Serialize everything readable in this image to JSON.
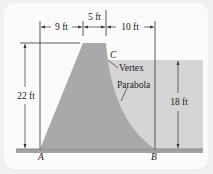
{
  "figure": {
    "dimensions": {
      "base_left": "9 ft",
      "top_width": "5 ft",
      "base_right": "10 ft",
      "dam_height": "22 ft",
      "water_depth": "18 ft"
    },
    "points": {
      "a": "A",
      "b": "B",
      "c": "C"
    },
    "callouts": {
      "vertex": "Vertex",
      "parabola": "Parabola"
    },
    "colors": {
      "dam": "#a9a9a9",
      "water": "#d4d4d4",
      "ground": "#9c9c9c",
      "lines": "#333333",
      "card": "#fbfbfb"
    }
  }
}
